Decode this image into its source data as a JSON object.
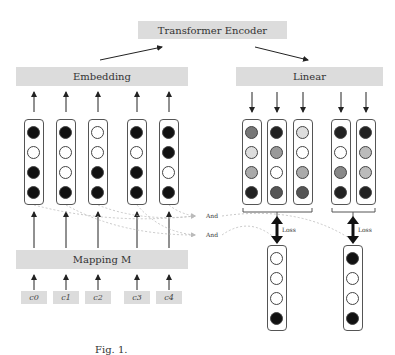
{
  "blocks": {
    "transformer": "Transformer Encoder",
    "embedding": "Embedding",
    "linear": "Linear",
    "mapping": "Mapping M"
  },
  "tokens": [
    "c0",
    "c1",
    "c2",
    "c3",
    "c4"
  ],
  "input_columns": [
    [
      "#111",
      "#fff",
      "#111",
      "#111"
    ],
    [
      "#111",
      "#fff",
      "#fff",
      "#111"
    ],
    [
      "#fff",
      "#fff",
      "#111",
      "#111"
    ],
    [
      "#111",
      "#fff",
      "#111",
      "#111"
    ],
    [
      "#111",
      "#111",
      "#fff",
      "#111"
    ]
  ],
  "output_columns": [
    [
      "#777",
      "#ddd",
      "#aaa",
      "#222"
    ],
    [
      "#222",
      "#999",
      "#fff",
      "#555"
    ],
    [
      "#ddd",
      "#fff",
      "#aaa",
      "#555"
    ],
    [
      "#222",
      "#fff",
      "#888",
      "#222"
    ],
    [
      "#222",
      "#bbb",
      "#bbb",
      "#222"
    ]
  ],
  "target_columns": [
    [
      "#fff",
      "#fff",
      "#fff",
      "#111"
    ],
    [
      "#111",
      "#fff",
      "#fff",
      "#111"
    ]
  ],
  "labels": {
    "and_1": "And",
    "and_2": "And",
    "loss_1": "Loss",
    "loss_2": "Loss"
  },
  "caption": "Fig. 1."
}
